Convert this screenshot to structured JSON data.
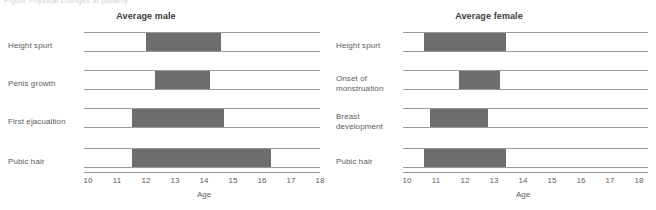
{
  "figure": {
    "cut_caption": "Figure  Physical changes at puberty",
    "bar_color": "#6e6e6e",
    "rule_color": "#9a9a9a"
  },
  "chart_data": {
    "type": "bar",
    "orientation": "horizontal-range",
    "title": "Physical changes at puberty",
    "xlabel": "Age",
    "ylabel": "",
    "xlim": [
      9.6,
      19.4
    ],
    "xticks": [
      10,
      11,
      12,
      13,
      14,
      15,
      16,
      17,
      18
    ],
    "grid": false,
    "legend": "none",
    "panels": [
      {
        "title": "Average male",
        "xlabel": "Age",
        "xticks": [
          "10",
          "11",
          "12",
          "13",
          "14",
          "15",
          "16",
          "17",
          "18"
        ],
        "categories": [
          "Height spurt",
          "Penis growth",
          "First ejacualtion",
          "Pubic hair"
        ],
        "ranges": [
          {
            "label": "Height spurt",
            "start": 12.0,
            "end": 14.6
          },
          {
            "label": "Penis growth",
            "start": 12.3,
            "end": 14.2
          },
          {
            "label": "First ejacualtion",
            "start": 11.5,
            "end": 14.7
          },
          {
            "label": "Pubic hair",
            "start": 11.5,
            "end": 16.3
          }
        ]
      },
      {
        "title": "Average female",
        "xlabel": "Age",
        "xticks": [
          "10",
          "11",
          "12",
          "13",
          "14",
          "15",
          "16",
          "17",
          "18"
        ],
        "categories": [
          "Height spurt",
          "Onset of monstruation",
          "Breast development",
          "Pubic hair"
        ],
        "ranges": [
          {
            "label": "Height spurt",
            "start": 10.6,
            "end": 13.4
          },
          {
            "label": "Onset of monstruation",
            "start": 11.8,
            "end": 13.2
          },
          {
            "label": "Breast development",
            "start": 10.8,
            "end": 12.8
          },
          {
            "label": "Pubic hair",
            "start": 10.6,
            "end": 13.4
          }
        ]
      }
    ]
  }
}
